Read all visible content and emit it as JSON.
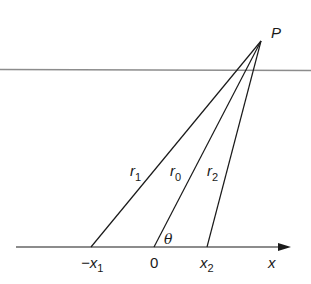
{
  "diagram": {
    "point_label": "P",
    "axis_label": "x",
    "angle_label": "θ",
    "rays": [
      {
        "name": "r1",
        "base": "r",
        "sub": "1",
        "foot_label_prefix": "−x",
        "foot_label_sub": "1"
      },
      {
        "name": "r0",
        "base": "r",
        "sub": "0",
        "foot_label": "0"
      },
      {
        "name": "r2",
        "base": "r",
        "sub": "2",
        "foot_label_prefix": "x",
        "foot_label_sub": "2"
      }
    ],
    "colors": {
      "line": "#1a1a1a",
      "reference_line": "#8c8c8c"
    }
  }
}
